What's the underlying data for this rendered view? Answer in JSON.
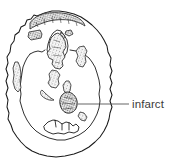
{
  "figure": {
    "kind": "line-drawing-anatomical-illustration",
    "background_color": "#ffffff",
    "ink_color": "#1a1a1a",
    "stipple_color": "#555555",
    "label_color": "#3b3b3b",
    "width": 187,
    "height": 166
  },
  "callouts": [
    {
      "id": "infarct",
      "label": "infarct",
      "leader_line": {
        "from_x": 78,
        "from_y": 104,
        "to_x": 129,
        "to_y": 104,
        "orientation": "horizontal"
      },
      "target": {
        "shape": "stippled-oval",
        "center_x": 68,
        "center_y": 103
      }
    }
  ],
  "regions": [
    {
      "id": "outer-cortex-outline",
      "name": "brain outer contour",
      "style": "irregular closed line"
    },
    {
      "id": "inner-cortex-outline",
      "name": "inner cortical ribbon",
      "style": "irregular closed line"
    },
    {
      "id": "anterior-stippled-band",
      "name": "anterior frontal stippled band",
      "style": "stippled"
    },
    {
      "id": "frontal-stippled-block-left",
      "name": "left frontal stippled block",
      "style": "stippled"
    },
    {
      "id": "frontal-stippled-block-right",
      "name": "right frontal stippled sliver",
      "style": "stippled"
    },
    {
      "id": "central-stippled-mass",
      "name": "central midline stippled mass",
      "style": "stippled"
    },
    {
      "id": "basal-ganglia-left",
      "name": "left basal ganglia stipple",
      "style": "stippled"
    },
    {
      "id": "basal-ganglia-right",
      "name": "right basal ganglia stipple",
      "style": "stippled"
    },
    {
      "id": "lateral-strip-left",
      "name": "left lateral stippled strip",
      "style": "stippled"
    },
    {
      "id": "thalamic-stipple",
      "name": "thalamic stippled patch",
      "style": "stippled"
    },
    {
      "id": "posterior-crescent",
      "name": "posterior crescent stipple",
      "style": "stippled"
    },
    {
      "id": "infarct-lesion",
      "name": "infarct lesion",
      "style": "stippled oval"
    },
    {
      "id": "posterior-small-stipple",
      "name": "posterior small stippled patch",
      "style": "stippled"
    },
    {
      "id": "occipital-outline",
      "name": "occipital / posterior fossa outline",
      "style": "irregular line"
    }
  ]
}
